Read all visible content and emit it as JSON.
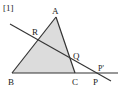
{
  "figure": {
    "label": "[1]",
    "points": {
      "A": {
        "name": "A",
        "x": 56,
        "y": 17
      },
      "B": {
        "name": "B",
        "x": 12,
        "y": 73
      },
      "C": {
        "name": "C",
        "x": 75,
        "y": 73
      },
      "R": {
        "name": "R",
        "x": 38,
        "y": 41
      },
      "Q": {
        "name": "Q",
        "x": 71,
        "y": 58
      },
      "P": {
        "name": "P",
        "x": 96,
        "y": 73
      },
      "P_prime": {
        "name": "P'"
      }
    },
    "colors": {
      "triangle_fill": "#dcdcdc",
      "stroke": "#333333"
    }
  }
}
